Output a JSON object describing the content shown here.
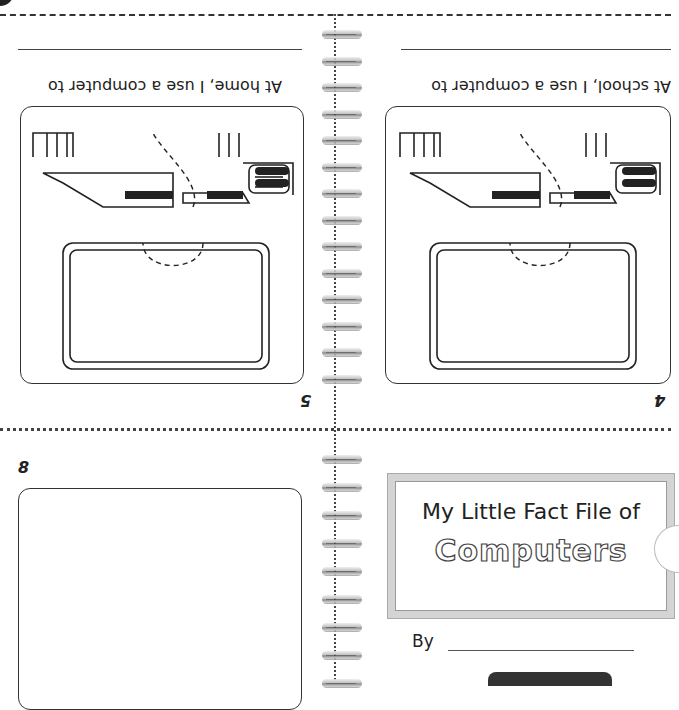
{
  "booklet": {
    "title_line1": "My Little Fact File of",
    "title_line2": "Computers",
    "by_label": "By"
  },
  "panels": {
    "home": {
      "prompt": "At home, I use a computer to",
      "page_number": "5",
      "orientation": "upside-down"
    },
    "school": {
      "prompt": "At school, I use a computer to",
      "page_number": "4",
      "orientation": "upside-down"
    },
    "back": {
      "page_number": "8"
    }
  },
  "illustrations": {
    "computer_icon": "computer-desktop-icon",
    "ring_icon": "spiral-binding-ring-icon"
  },
  "colors": {
    "ink": "#222222",
    "frame_gray": "#d4d4d4",
    "background": "#ffffff"
  }
}
